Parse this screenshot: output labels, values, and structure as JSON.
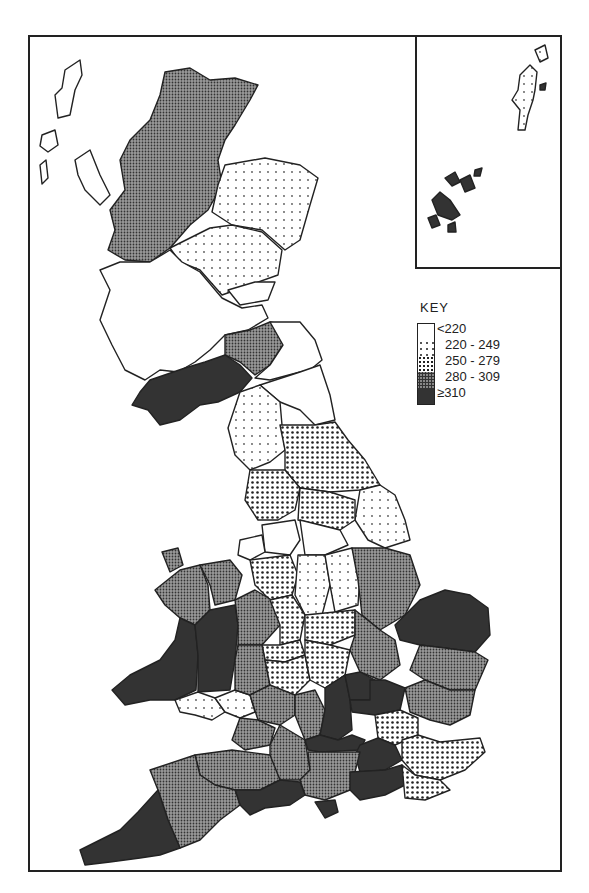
{
  "map": {
    "type": "choropleth",
    "subject": "Great Britain counties / regions",
    "inset": "Orkney and Shetland",
    "legend": {
      "title": "KEY",
      "classes": [
        {
          "label": "<220",
          "pattern": "white"
        },
        {
          "label": "220 - 249",
          "pattern": "sparse-dots"
        },
        {
          "label": "250 - 279",
          "pattern": "dots"
        },
        {
          "label": "280 - 309",
          "pattern": "dense-stipple"
        },
        {
          "label": "≥310",
          "pattern": "dark"
        }
      ]
    },
    "regions": [
      {
        "name": "Shetland",
        "class": "220 - 249"
      },
      {
        "name": "Orkney",
        "class": "≥310"
      },
      {
        "name": "Western Isles",
        "class": "<220"
      },
      {
        "name": "Highland",
        "class": "280 - 309"
      },
      {
        "name": "Grampian",
        "class": "220 - 249"
      },
      {
        "name": "Tayside",
        "class": "220 - 249"
      },
      {
        "name": "Fife",
        "class": "<220"
      },
      {
        "name": "Central",
        "class": "<220"
      },
      {
        "name": "Lothian",
        "class": "<220"
      },
      {
        "name": "Strathclyde",
        "class": "<220"
      },
      {
        "name": "Borders",
        "class": "280 - 309"
      },
      {
        "name": "Dumfries and Galloway",
        "class": "≥310"
      },
      {
        "name": "Northumberland",
        "class": "<220"
      },
      {
        "name": "Tyne and Wear",
        "class": "<220"
      },
      {
        "name": "Durham",
        "class": "<220"
      },
      {
        "name": "Cleveland",
        "class": "<220"
      },
      {
        "name": "Cumbria",
        "class": "220 - 249"
      },
      {
        "name": "North Yorkshire",
        "class": "250 - 279"
      },
      {
        "name": "Lancashire",
        "class": "250 - 279"
      },
      {
        "name": "West Yorkshire",
        "class": "250 - 279"
      },
      {
        "name": "Humberside",
        "class": "220 - 249"
      },
      {
        "name": "Merseyside",
        "class": "<220"
      },
      {
        "name": "Greater Manchester",
        "class": "<220"
      },
      {
        "name": "South Yorkshire",
        "class": "<220"
      },
      {
        "name": "Cheshire",
        "class": "250 - 279"
      },
      {
        "name": "Derbyshire",
        "class": "220 - 249"
      },
      {
        "name": "Nottinghamshire",
        "class": "220 - 249"
      },
      {
        "name": "Lincolnshire",
        "class": "280 - 309"
      },
      {
        "name": "Gwynedd",
        "class": "280 - 309"
      },
      {
        "name": "Clwyd",
        "class": "280 - 309"
      },
      {
        "name": "Dyfed",
        "class": "≥310"
      },
      {
        "name": "Powys",
        "class": "≥310"
      },
      {
        "name": "Glamorgan",
        "class": "220 - 249"
      },
      {
        "name": "Gwent",
        "class": "220 - 249"
      },
      {
        "name": "Shropshire",
        "class": "280 - 309"
      },
      {
        "name": "Staffordshire",
        "class": "250 - 279"
      },
      {
        "name": "West Midlands",
        "class": "250 - 279"
      },
      {
        "name": "Leicestershire",
        "class": "250 - 279"
      },
      {
        "name": "Hereford and Worcester",
        "class": "280 - 309"
      },
      {
        "name": "Warwickshire",
        "class": "250 - 279"
      },
      {
        "name": "Northamptonshire",
        "class": "250 - 279"
      },
      {
        "name": "Cambridgeshire",
        "class": "280 - 309"
      },
      {
        "name": "Norfolk",
        "class": "≥310"
      },
      {
        "name": "Suffolk",
        "class": "280 - 309"
      },
      {
        "name": "Gloucestershire",
        "class": "280 - 309"
      },
      {
        "name": "Oxfordshire",
        "class": "280 - 309"
      },
      {
        "name": "Buckinghamshire",
        "class": "≥310"
      },
      {
        "name": "Bedfordshire",
        "class": "≥310"
      },
      {
        "name": "Hertfordshire",
        "class": "≥310"
      },
      {
        "name": "Essex",
        "class": "280 - 309"
      },
      {
        "name": "Greater London",
        "class": "250 - 279"
      },
      {
        "name": "Avon",
        "class": "280 - 309"
      },
      {
        "name": "Wiltshire",
        "class": "280 - 309"
      },
      {
        "name": "Berkshire",
        "class": "≥310"
      },
      {
        "name": "Surrey",
        "class": "≥310"
      },
      {
        "name": "Kent",
        "class": "250 - 279"
      },
      {
        "name": "Somerset",
        "class": "280 - 309"
      },
      {
        "name": "Hampshire",
        "class": "280 - 309"
      },
      {
        "name": "West Sussex",
        "class": "≥310"
      },
      {
        "name": "East Sussex",
        "class": "250 - 279"
      },
      {
        "name": "Dorset",
        "class": "≥310"
      },
      {
        "name": "Isle of Wight",
        "class": "280 - 309"
      },
      {
        "name": "Devon",
        "class": "280 - 309"
      },
      {
        "name": "Cornwall",
        "class": "≥310"
      }
    ]
  },
  "colors": {
    "line": "#222222",
    "class_0": "#ffffff",
    "class_1_dot": "#555555",
    "class_2_dot": "#222222",
    "class_3_base": "#888888",
    "class_4": "#333333"
  }
}
